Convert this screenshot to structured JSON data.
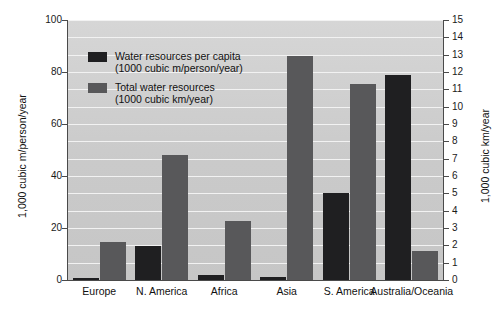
{
  "chart_data": {
    "type": "bar",
    "title": "",
    "subtitle": "",
    "categories": [
      "Europe",
      "N. America",
      "Africa",
      "Asia",
      "S. America",
      "Australia/Oceania"
    ],
    "series": [
      {
        "name": "Water resources per capita",
        "unit": "(1000 cubic m/person/year)",
        "axis": "left",
        "color": "#1f1f21",
        "values": [
          0.7,
          13.0,
          2.0,
          1.2,
          33.5,
          79.0
        ]
      },
      {
        "name": "Total water resources",
        "unit": "(1000 cubic km/year)",
        "axis": "right",
        "color": "#58585a",
        "values": [
          2.2,
          7.2,
          3.4,
          12.9,
          11.3,
          1.7
        ]
      }
    ],
    "xlabel": "",
    "ylabel_left": "1,000 cubic m/person/year",
    "ylabel_right": "1,000 cubic km/year",
    "ylim_left": [
      0,
      100
    ],
    "ylim_right": [
      0,
      15
    ],
    "yticks_left": [
      0,
      20,
      40,
      60,
      80,
      100
    ],
    "yticks_right": [
      0,
      1,
      2,
      3,
      4,
      5,
      6,
      7,
      8,
      9,
      10,
      11,
      12,
      13,
      14,
      15
    ],
    "grid": true,
    "legend_position": "inside-top-left",
    "plot_background": "#cdcdcd",
    "gridline_color": "#f2f2f2"
  },
  "legend": {
    "entries": [
      {
        "label": "Water resources per capita",
        "sublabel": "(1000 cubic m/person/year)"
      },
      {
        "label": "Total water resources",
        "sublabel": "(1000 cubic km/year)"
      }
    ]
  }
}
